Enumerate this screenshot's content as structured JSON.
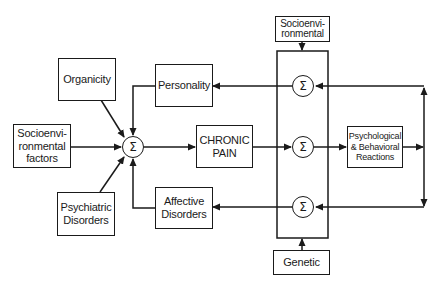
{
  "diagram": {
    "type": "block-diagram",
    "summation_symbol": "Σ",
    "nodes": {
      "organicity": "Organicity",
      "personality": "Personality",
      "socioenv_factors": "Socioenvi-\nronmental\nfactors",
      "chronic_pain": "CHRONIC\nPAIN",
      "psychiatric": "Psychiatric\nDisorders",
      "affective": "Affective\nDisorders",
      "socioenv_top": "Socioenvi-\nronmental",
      "psych_behav": "Psychological\n& Behavioral\nReactions",
      "genetic": "Genetic"
    },
    "edges": [
      {
        "from": "Organicity",
        "to": "Σ (main)"
      },
      {
        "from": "Personality",
        "to": "Σ (main)"
      },
      {
        "from": "Socioenvironmental factors",
        "to": "Σ (main)"
      },
      {
        "from": "Psychiatric Disorders",
        "to": "Σ (main)"
      },
      {
        "from": "Affective Disorders",
        "to": "Σ (main)"
      },
      {
        "from": "Σ (main)",
        "to": "CHRONIC PAIN"
      },
      {
        "from": "CHRONIC PAIN",
        "to": "Σ (middle)"
      },
      {
        "from": "Σ (middle)",
        "to": "Psychological & Behavioral Reactions"
      },
      {
        "from": "Psychological & Behavioral Reactions",
        "to": "Σ (top)"
      },
      {
        "from": "Psychological & Behavioral Reactions",
        "to": "Σ (bottom)"
      },
      {
        "from": "Σ (top)",
        "to": "Personality"
      },
      {
        "from": "Σ (bottom)",
        "to": "Affective Disorders"
      },
      {
        "from": "Socioenvironmental",
        "to": "modifier block"
      },
      {
        "from": "Genetic",
        "to": "modifier block"
      }
    ]
  }
}
